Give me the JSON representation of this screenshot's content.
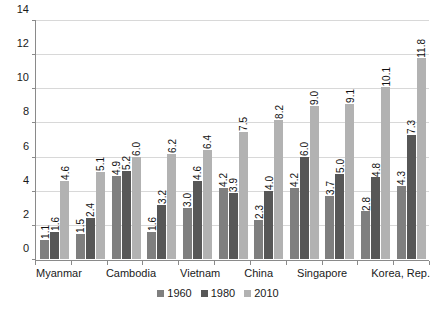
{
  "chart_data": {
    "type": "bar",
    "title": "",
    "subtitle": "",
    "xlabel": "",
    "ylabel": "",
    "ylim": [
      0,
      14
    ],
    "yticks": [
      0,
      2,
      4,
      6,
      8,
      10,
      12,
      14
    ],
    "grid": true,
    "legend_position": "bottom",
    "categories": [
      "Myanmar",
      "",
      "Cambodia",
      "",
      "Vietnam",
      "",
      "China",
      "",
      "Singapore",
      "",
      "Korea, Rep."
    ],
    "series": [
      {
        "name": "1960",
        "color": "#7f7f7f",
        "values": [
          1.1,
          1.5,
          4.9,
          1.6,
          3.0,
          4.2,
          2.3,
          4.2,
          3.7,
          2.8,
          4.3
        ]
      },
      {
        "name": "1980",
        "color": "#575757",
        "values": [
          1.6,
          2.4,
          5.2,
          3.2,
          4.6,
          3.9,
          4.0,
          6.0,
          5.0,
          4.8,
          7.3
        ]
      },
      {
        "name": "2010",
        "color": "#b2b2b2",
        "values": [
          4.6,
          5.1,
          6.0,
          6.2,
          6.4,
          7.5,
          8.2,
          9.0,
          9.1,
          10.1,
          11.8
        ]
      }
    ],
    "data_labels": [
      [
        "1.1",
        "1.6",
        "4.6"
      ],
      [
        "1.5",
        "2.4",
        "5.1"
      ],
      [
        "4.9",
        "5.2",
        "6.0"
      ],
      [
        "1.6",
        "3.2",
        "6.2"
      ],
      [
        "3.0",
        "4.6",
        "6.4"
      ],
      [
        "4.2",
        "3.9",
        "7.5"
      ],
      [
        "2.3",
        "4.0",
        "8.2"
      ],
      [
        "4.2",
        "6.0",
        "9.0"
      ],
      [
        "3.7",
        "5.0",
        "9.1"
      ],
      [
        "2.8",
        "4.8",
        "10.1"
      ],
      [
        "4.3",
        "7.3",
        "11.8"
      ]
    ]
  },
  "legend": {
    "items": [
      {
        "label": "1960",
        "color": "#7f7f7f"
      },
      {
        "label": "1980",
        "color": "#575757"
      },
      {
        "label": "2010",
        "color": "#b2b2b2"
      }
    ]
  }
}
